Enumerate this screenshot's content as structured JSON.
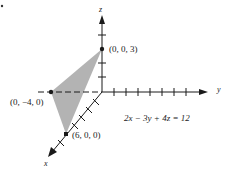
{
  "figure": {
    "equation": "2x − 3y + 4z = 12",
    "axes": {
      "x_label": "x",
      "y_label": "y",
      "z_label": "z"
    },
    "points": [
      {
        "label": "(0, 0, 3)",
        "coords": [
          0,
          0,
          3
        ]
      },
      {
        "label": "(0, −4, 0)",
        "coords": [
          0,
          -4,
          0
        ]
      },
      {
        "label": "(6, 0, 0)",
        "coords": [
          6,
          0,
          0
        ]
      }
    ],
    "corner_mark": "·",
    "colors": {
      "plane_fill": "#b3b3b3",
      "axis": "#1a1a1a",
      "background": "#ffffff"
    }
  }
}
